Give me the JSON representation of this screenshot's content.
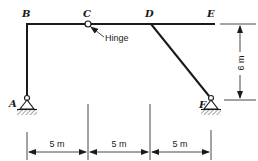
{
  "diagram": {
    "type": "structural-frame",
    "nodes": {
      "A": {
        "label": "A",
        "support": "pin"
      },
      "B": {
        "label": "B"
      },
      "C": {
        "label": "C",
        "connection": "hinge"
      },
      "D": {
        "label": "D"
      },
      "E": {
        "label": "E"
      },
      "F": {
        "label": "F",
        "support": "pin"
      }
    },
    "members": [
      {
        "from": "A",
        "to": "B"
      },
      {
        "from": "B",
        "to": "C"
      },
      {
        "from": "C",
        "to": "D"
      },
      {
        "from": "D",
        "to": "E"
      },
      {
        "from": "D",
        "to": "F"
      }
    ],
    "annotations": {
      "hinge_label": "Hinge"
    },
    "dimensions": {
      "span_1": "5 m",
      "span_2": "5 m",
      "span_3": "5 m",
      "height": "6 m"
    },
    "colors": {
      "line": "#1a1a1a",
      "background": "#ffffff"
    }
  }
}
